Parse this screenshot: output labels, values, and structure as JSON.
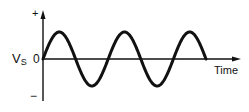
{
  "diagram": {
    "title": "",
    "y_axis": {
      "plus_label": "+",
      "minus_label": "−",
      "zero_label": "0",
      "quantity_label": "V",
      "quantity_subscript": "S"
    },
    "x_axis": {
      "label": "Time"
    },
    "waveform": {
      "type": "sine",
      "cycles": 2.5,
      "color": "#111111"
    }
  }
}
